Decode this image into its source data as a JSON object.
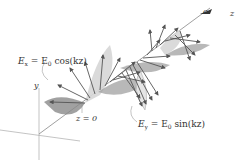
{
  "diagram": {
    "type": "circularly-polarized-wave",
    "labels": {
      "ex_equation": "E",
      "ex_sub": "x",
      "ex_rhs": " = E",
      "ex_rhs_sub": "0",
      "ex_func": " cos(kz)",
      "ey_equation": "E",
      "ey_sub": "y",
      "ey_rhs": " = E",
      "ey_rhs_sub": "0",
      "ey_func": " sin(kz)",
      "origin": "z = 0",
      "y_axis": "y",
      "z_axis": "z",
      "c_label": "c"
    },
    "colors": {
      "axis": "#999999",
      "arrow": "#555555",
      "lobe_dark": "#8a8a8a",
      "lobe_light": "#d8d8d8",
      "helix": "#777777"
    }
  }
}
